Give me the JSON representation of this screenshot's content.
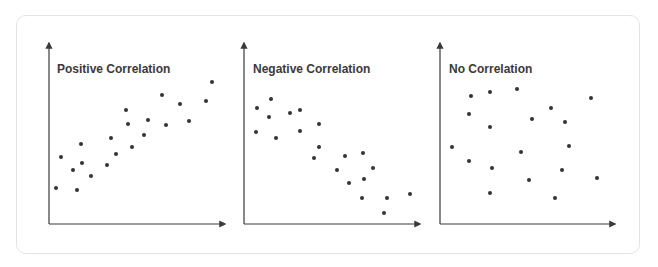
{
  "chart_data": [
    {
      "type": "scatter",
      "title": "Positive Correlation",
      "xlabel": "",
      "ylabel": "",
      "grid": false,
      "axes": {
        "origin": [
          49,
          224
        ],
        "x_end": 225,
        "y_end": 43
      },
      "points": [
        [
          56,
          188
        ],
        [
          61,
          157
        ],
        [
          73,
          170
        ],
        [
          77,
          190
        ],
        [
          81,
          144
        ],
        [
          82,
          163
        ],
        [
          91,
          176
        ],
        [
          107,
          165
        ],
        [
          111,
          138
        ],
        [
          116,
          154
        ],
        [
          126,
          110
        ],
        [
          128,
          124
        ],
        [
          132,
          147
        ],
        [
          144,
          135
        ],
        [
          148,
          120
        ],
        [
          162,
          95
        ],
        [
          166,
          125
        ],
        [
          180,
          104
        ],
        [
          189,
          121
        ],
        [
          206,
          101
        ],
        [
          212,
          82
        ]
      ]
    },
    {
      "type": "scatter",
      "title": "Negative Correlation",
      "xlabel": "",
      "ylabel": "",
      "grid": false,
      "axes": {
        "origin": [
          244,
          224
        ],
        "x_end": 420,
        "y_end": 43
      },
      "points": [
        [
          257,
          108
        ],
        [
          271,
          99
        ],
        [
          269,
          117
        ],
        [
          256,
          132
        ],
        [
          276,
          138
        ],
        [
          290,
          113
        ],
        [
          300,
          110
        ],
        [
          300,
          131
        ],
        [
          319,
          124
        ],
        [
          319,
          147
        ],
        [
          314,
          158
        ],
        [
          345,
          156
        ],
        [
          363,
          153
        ],
        [
          337,
          170
        ],
        [
          373,
          168
        ],
        [
          364,
          179
        ],
        [
          349,
          183
        ],
        [
          362,
          198
        ],
        [
          387,
          198
        ],
        [
          410,
          194
        ],
        [
          384,
          213
        ]
      ]
    },
    {
      "type": "scatter",
      "title": "No Correlation",
      "xlabel": "",
      "ylabel": "",
      "grid": false,
      "axes": {
        "origin": [
          440,
          224
        ],
        "x_end": 615,
        "y_end": 43
      },
      "points": [
        [
          471,
          96
        ],
        [
          490,
          92
        ],
        [
          517,
          89
        ],
        [
          591,
          98
        ],
        [
          469,
          114
        ],
        [
          551,
          108
        ],
        [
          532,
          119
        ],
        [
          565,
          122
        ],
        [
          490,
          127
        ],
        [
          452,
          147
        ],
        [
          569,
          146
        ],
        [
          521,
          152
        ],
        [
          469,
          161
        ],
        [
          492,
          168
        ],
        [
          562,
          170
        ],
        [
          529,
          180
        ],
        [
          597,
          178
        ],
        [
          490,
          193
        ],
        [
          555,
          198
        ]
      ]
    }
  ],
  "colors": {
    "axis": "#3a3a3a",
    "point": "#333333",
    "title": "#3a3a3a",
    "frame_border": "#e4e4e4"
  }
}
